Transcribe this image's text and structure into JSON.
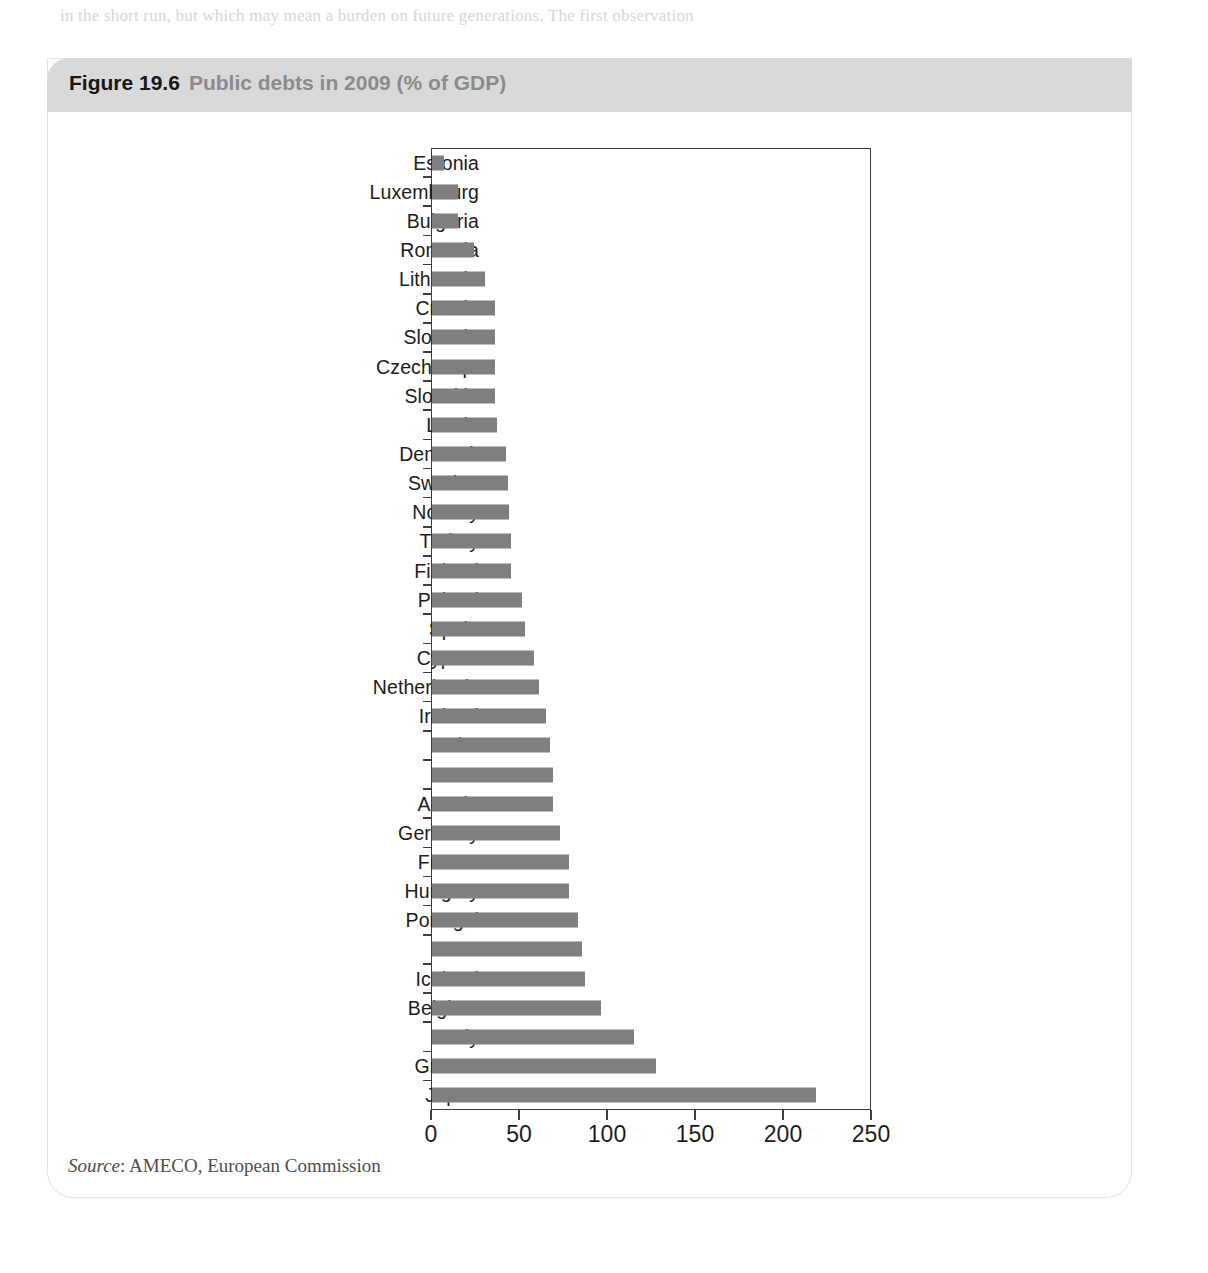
{
  "figure": {
    "number": "Figure 19.6",
    "title": "Public debts in 2009 (% of GDP)",
    "source_prefix": "Source",
    "source_text": ": AMECO, European Commission"
  },
  "colors": {
    "bar": "#7f7f7f",
    "header_band": "#d9d9d9",
    "axis": "#3d3d3d",
    "title_number": "#161616",
    "title_text": "#8b8b8b"
  },
  "chart_data": {
    "type": "bar",
    "orientation": "horizontal",
    "title": "Public debts in 2009 (% of GDP)",
    "xlabel": "",
    "ylabel": "",
    "xlim": [
      0,
      250
    ],
    "xticks": [
      0,
      50,
      100,
      150,
      200,
      250
    ],
    "xtick_labels": [
      "0",
      "50",
      "100",
      "150",
      "200",
      "250"
    ],
    "grid": false,
    "legend": null,
    "source": "AMECO, European Commission",
    "categories": [
      "Estonia",
      "Luxembourg",
      "Bulgaria",
      "Romania",
      "Lithuania",
      "Croatia",
      "Slovenia",
      "Czech Rep.",
      "Slovakia",
      "Latvia",
      "Denmark",
      "Sweden",
      "Norway",
      "Turkey",
      "Finland",
      "Poland",
      "Spain",
      "Cyprus",
      "Netherlands",
      "Ireland",
      "Malta",
      "UK",
      "Austria",
      "Germany",
      "France",
      "Hungary",
      "Portugal",
      "USA",
      "Iceland",
      "Belgium",
      "Italy",
      "Greece",
      "Japan"
    ],
    "values": [
      7,
      15,
      15,
      24,
      30,
      36,
      36,
      36,
      36,
      37,
      42,
      43,
      44,
      45,
      45,
      51,
      53,
      58,
      61,
      65,
      67,
      69,
      69,
      73,
      78,
      78,
      83,
      85,
      87,
      96,
      115,
      127,
      218
    ]
  },
  "page_bleed": {
    "lines": [
      {
        "text": "in the short run, but which may mean a burden on future generations. The first observation",
        "x": 60,
        "y": 10
      },
      {
        "text": "that is often made is that fiscal policy is much more difficult to use than monetary policy.",
        "x": 205,
        "y": 74
      },
      {
        "text": "with a debt ratio over 15 per cent",
        "x": 740,
        "y": 1014
      },
      {
        "text": "and may not signal any serious problem. The second observation is that the temptation to use",
        "x": 52,
        "y": 1040
      },
      {
        "text": "the debt may well have been the only way to deal with a recession while keeping the",
        "x": 60,
        "y": 1064
      },
      {
        "text": "spending is often seen as a way of supporting the economy. A third point is that the public",
        "x": 56,
        "y": 1089
      },
      {
        "text": "smaller. Yet, one can also argue that a period of low interest rates makes borrowing cheaper.",
        "x": 92,
        "y": 1152
      }
    ]
  }
}
